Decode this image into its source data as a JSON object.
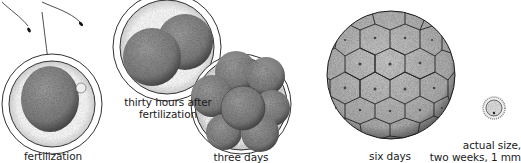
{
  "diagram": {
    "type": "embryo-development-stages",
    "stages": [
      {
        "id": "fertilization",
        "label": "fertilization"
      },
      {
        "id": "thirty-hours",
        "label_line1": "thirty hours after",
        "label_line2": "fertilization"
      },
      {
        "id": "three-days",
        "label": "three days"
      },
      {
        "id": "six-days",
        "label": "six days"
      },
      {
        "id": "two-weeks",
        "label_line1": "actual size,",
        "label_line2": "two weeks, 1 mm"
      }
    ],
    "colors": {
      "outline": "#1a1a1a",
      "cell_fill": "#8c8c8c",
      "zona_fill": "#e4e4e4",
      "blast_fill": "#b5b5b5"
    }
  }
}
